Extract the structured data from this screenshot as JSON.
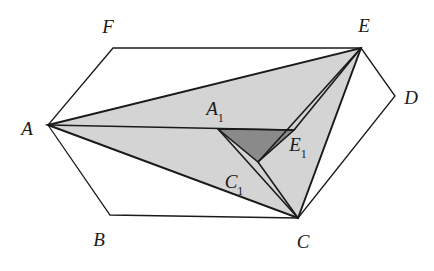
{
  "figure": {
    "canvas": {
      "width": 434,
      "height": 271
    },
    "colors": {
      "stroke": "#1a1a1a",
      "light_fill": "#d4d4d4",
      "dark_fill": "#8a8a8a",
      "background": "#ffffff",
      "label": "#1a1a1a"
    },
    "stroke_widths": {
      "hexagon": 1.3,
      "triangle": 1.9,
      "inner": 1.6
    }
  },
  "points": {
    "A": {
      "x": 48,
      "y": 125,
      "label": "A",
      "sub": "",
      "lx": 27,
      "ly": 128
    },
    "B": {
      "x": 110,
      "y": 215,
      "label": "B",
      "sub": "",
      "lx": 99,
      "ly": 239
    },
    "C": {
      "x": 298,
      "y": 218,
      "label": "C",
      "sub": "",
      "lx": 303,
      "ly": 241
    },
    "D": {
      "x": 395,
      "y": 96,
      "label": "D",
      "sub": "",
      "lx": 411,
      "ly": 97
    },
    "E": {
      "x": 361,
      "y": 48,
      "label": "E",
      "sub": "",
      "lx": 364,
      "ly": 25
    },
    "F": {
      "x": 113,
      "y": 48,
      "label": "F",
      "sub": "",
      "lx": 108,
      "ly": 26
    },
    "A1": {
      "x": 218,
      "y": 129,
      "label": "A",
      "sub": "1",
      "lx": 215,
      "ly": 110
    },
    "E1": {
      "x": 294,
      "y": 130,
      "label": "E",
      "sub": "1",
      "lx": 298,
      "ly": 146
    },
    "C1": {
      "x": 258,
      "y": 162,
      "label": "C",
      "sub": "1",
      "lx": 234,
      "ly": 183
    }
  },
  "shapes": {
    "hexagon": {
      "name": "hexagon-ABCDEF",
      "vertex_order": [
        "A",
        "B",
        "C",
        "D",
        "E",
        "F"
      ]
    },
    "triangle_ACE": {
      "name": "triangle-ACE",
      "vertex_order": [
        "A",
        "C",
        "E"
      ],
      "fill": "light"
    },
    "triangle_A1C1E1": {
      "name": "triangle-A1C1E1",
      "vertex_order": [
        "A1",
        "C1",
        "E1"
      ],
      "fill": "dark"
    },
    "cevians": [
      {
        "name": "cevian-A-to-E1",
        "from": "A",
        "to": "E1"
      },
      {
        "name": "cevian-E-to-C1",
        "from": "E",
        "to": "C1"
      },
      {
        "name": "cevian-C-to-A1",
        "from": "C",
        "to": "A1"
      },
      {
        "name": "cevian-C1-to-C",
        "from": "C1",
        "to": "C"
      },
      {
        "name": "cevian-E1-to-E",
        "from": "E1",
        "to": "E"
      }
    ]
  },
  "labels": {
    "A": "A",
    "B": "B",
    "C": "C",
    "D": "D",
    "E": "E",
    "F": "F",
    "A1": "A",
    "C1": "C",
    "E1": "E",
    "sub1": "1"
  }
}
